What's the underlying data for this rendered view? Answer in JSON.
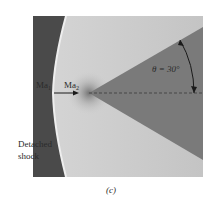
{
  "figure": {
    "labels": {
      "upstream_mach": "Ma",
      "upstream_mach_sub": "1",
      "downstream_mach": "Ma",
      "downstream_mach_sub": "2",
      "angle": "θ = 30°",
      "shock_line1": "Detached",
      "shock_line2": "shock",
      "caption": "(c)"
    },
    "cone_half_angle_deg": 30,
    "colors": {
      "shock_region": "#4a4a4a",
      "flow_field": "#c9c9c9",
      "cone": "#7a7a7a",
      "shock_edge": "#e8e8e8",
      "text": "#2a2a2a"
    }
  }
}
